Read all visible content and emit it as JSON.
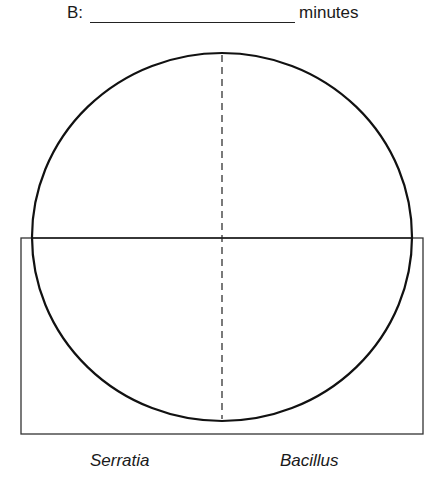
{
  "header": {
    "label": "B:",
    "unit": "minutes"
  },
  "diagram": {
    "circle": {
      "cx": 222,
      "cy": 237,
      "rx": 190,
      "ry": 184
    },
    "rectangle": {
      "x": 21,
      "y": 238,
      "width": 402,
      "height": 196
    },
    "divider_dashed": {
      "x": 222,
      "y1": 53,
      "y2": 421
    },
    "stroke_color": "#1a1a1a"
  },
  "captions": {
    "left": "Serratia",
    "right": "Bacillus"
  }
}
